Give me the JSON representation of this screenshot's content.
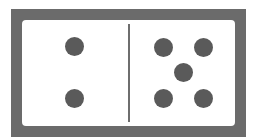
{
  "domino": {
    "left_value": 2,
    "right_value": 5,
    "colors": {
      "frame": "#6b6b6b",
      "face": "#ffffff",
      "pip": "#5a5a5a",
      "divider": "#6e6e6e"
    },
    "left_pips": [
      {
        "x": 52,
        "y": 26
      },
      {
        "x": 52,
        "y": 78
      }
    ],
    "right_pips": [
      {
        "x": 141,
        "y": 27
      },
      {
        "x": 181,
        "y": 27
      },
      {
        "x": 161,
        "y": 52
      },
      {
        "x": 141,
        "y": 78
      },
      {
        "x": 181,
        "y": 78
      }
    ]
  }
}
